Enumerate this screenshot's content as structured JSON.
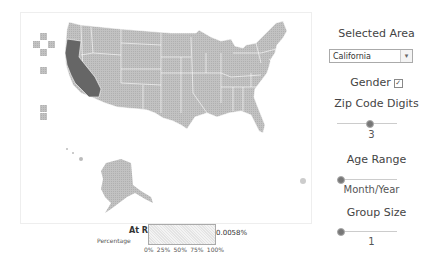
{
  "map": {
    "selected_state": "California",
    "colors": {
      "default": "#bdbdbd",
      "selected": "#666666",
      "border": "#ffffff"
    }
  },
  "controls": {
    "selected_area": {
      "title": "Selected Area",
      "value": "California",
      "arrow": "▾"
    },
    "gender": {
      "label": "Gender",
      "checked": true,
      "check_glyph": "☑"
    },
    "zip_code": {
      "title": "Zip Code Digits",
      "value": "3"
    },
    "age_range": {
      "title": "Age Range",
      "value": "Month/Year"
    },
    "group_size": {
      "title": "Group Size",
      "value": "1"
    }
  },
  "legend": {
    "title": "At Risk",
    "subtitle": "Percentage",
    "value": "0.0058%",
    "ticks": [
      "0%",
      "25%",
      "50%",
      "75%",
      "100%"
    ]
  }
}
